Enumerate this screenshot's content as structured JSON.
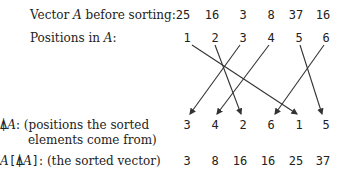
{
  "labels": {
    "vector_before_prefix": "Vector ",
    "vector_before_var": "A",
    "vector_before_suffix": " before sorting:",
    "positions_prefix": "Positions in ",
    "positions_var": "A",
    "positions_suffix": ":",
    "grade_symbol": "⍋",
    "grade_var": "A",
    "grade_desc_line1": ": (positions the sorted",
    "grade_desc_line2": "elements come from)",
    "sorted_var": "A",
    "sorted_open": "[",
    "sorted_grade": "⍋",
    "sorted_inner_var": "A",
    "sorted_close": "]",
    "sorted_desc": ": (the sorted vector)"
  },
  "vector_before": [
    "25",
    "16",
    "3",
    "8",
    "37",
    "16"
  ],
  "positions": [
    "1",
    "2",
    "3",
    "4",
    "5",
    "6"
  ],
  "grade_up": [
    "3",
    "4",
    "2",
    "6",
    "1",
    "5"
  ],
  "sorted": [
    "3",
    "8",
    "16",
    "16",
    "25",
    "37"
  ]
}
